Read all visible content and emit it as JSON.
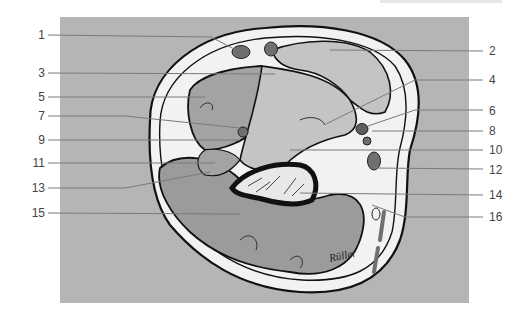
{
  "figure": {
    "signature": "Rüller",
    "colors": {
      "background_panel": "#b5b5b5",
      "skin_fat": "#f2f2f2",
      "muscle": "#9b9b9b",
      "muscle_light": "#c4c4c4",
      "outline": "#111111",
      "vessel": "#6f6f6f",
      "leader_line": "#7a7a7a",
      "label_text": "#444444"
    }
  },
  "labels_left": [
    {
      "id": "1",
      "text": "1",
      "y": 35
    },
    {
      "id": "3",
      "text": "3",
      "y": 73
    },
    {
      "id": "5",
      "text": "5",
      "y": 97
    },
    {
      "id": "7",
      "text": "7",
      "y": 116
    },
    {
      "id": "9",
      "text": "9",
      "y": 140
    },
    {
      "id": "11",
      "text": "11",
      "y": 163
    },
    {
      "id": "13",
      "text": "13",
      "y": 188
    },
    {
      "id": "15",
      "text": "15",
      "y": 213
    }
  ],
  "labels_right": [
    {
      "id": "2",
      "text": "2",
      "y": 51
    },
    {
      "id": "4",
      "text": "4",
      "y": 80
    },
    {
      "id": "6",
      "text": "6",
      "y": 111
    },
    {
      "id": "8",
      "text": "8",
      "y": 131
    },
    {
      "id": "10",
      "text": "10",
      "y": 150
    },
    {
      "id": "12",
      "text": "12",
      "y": 170
    },
    {
      "id": "14",
      "text": "14",
      "y": 195
    },
    {
      "id": "16",
      "text": "16",
      "y": 217
    }
  ]
}
